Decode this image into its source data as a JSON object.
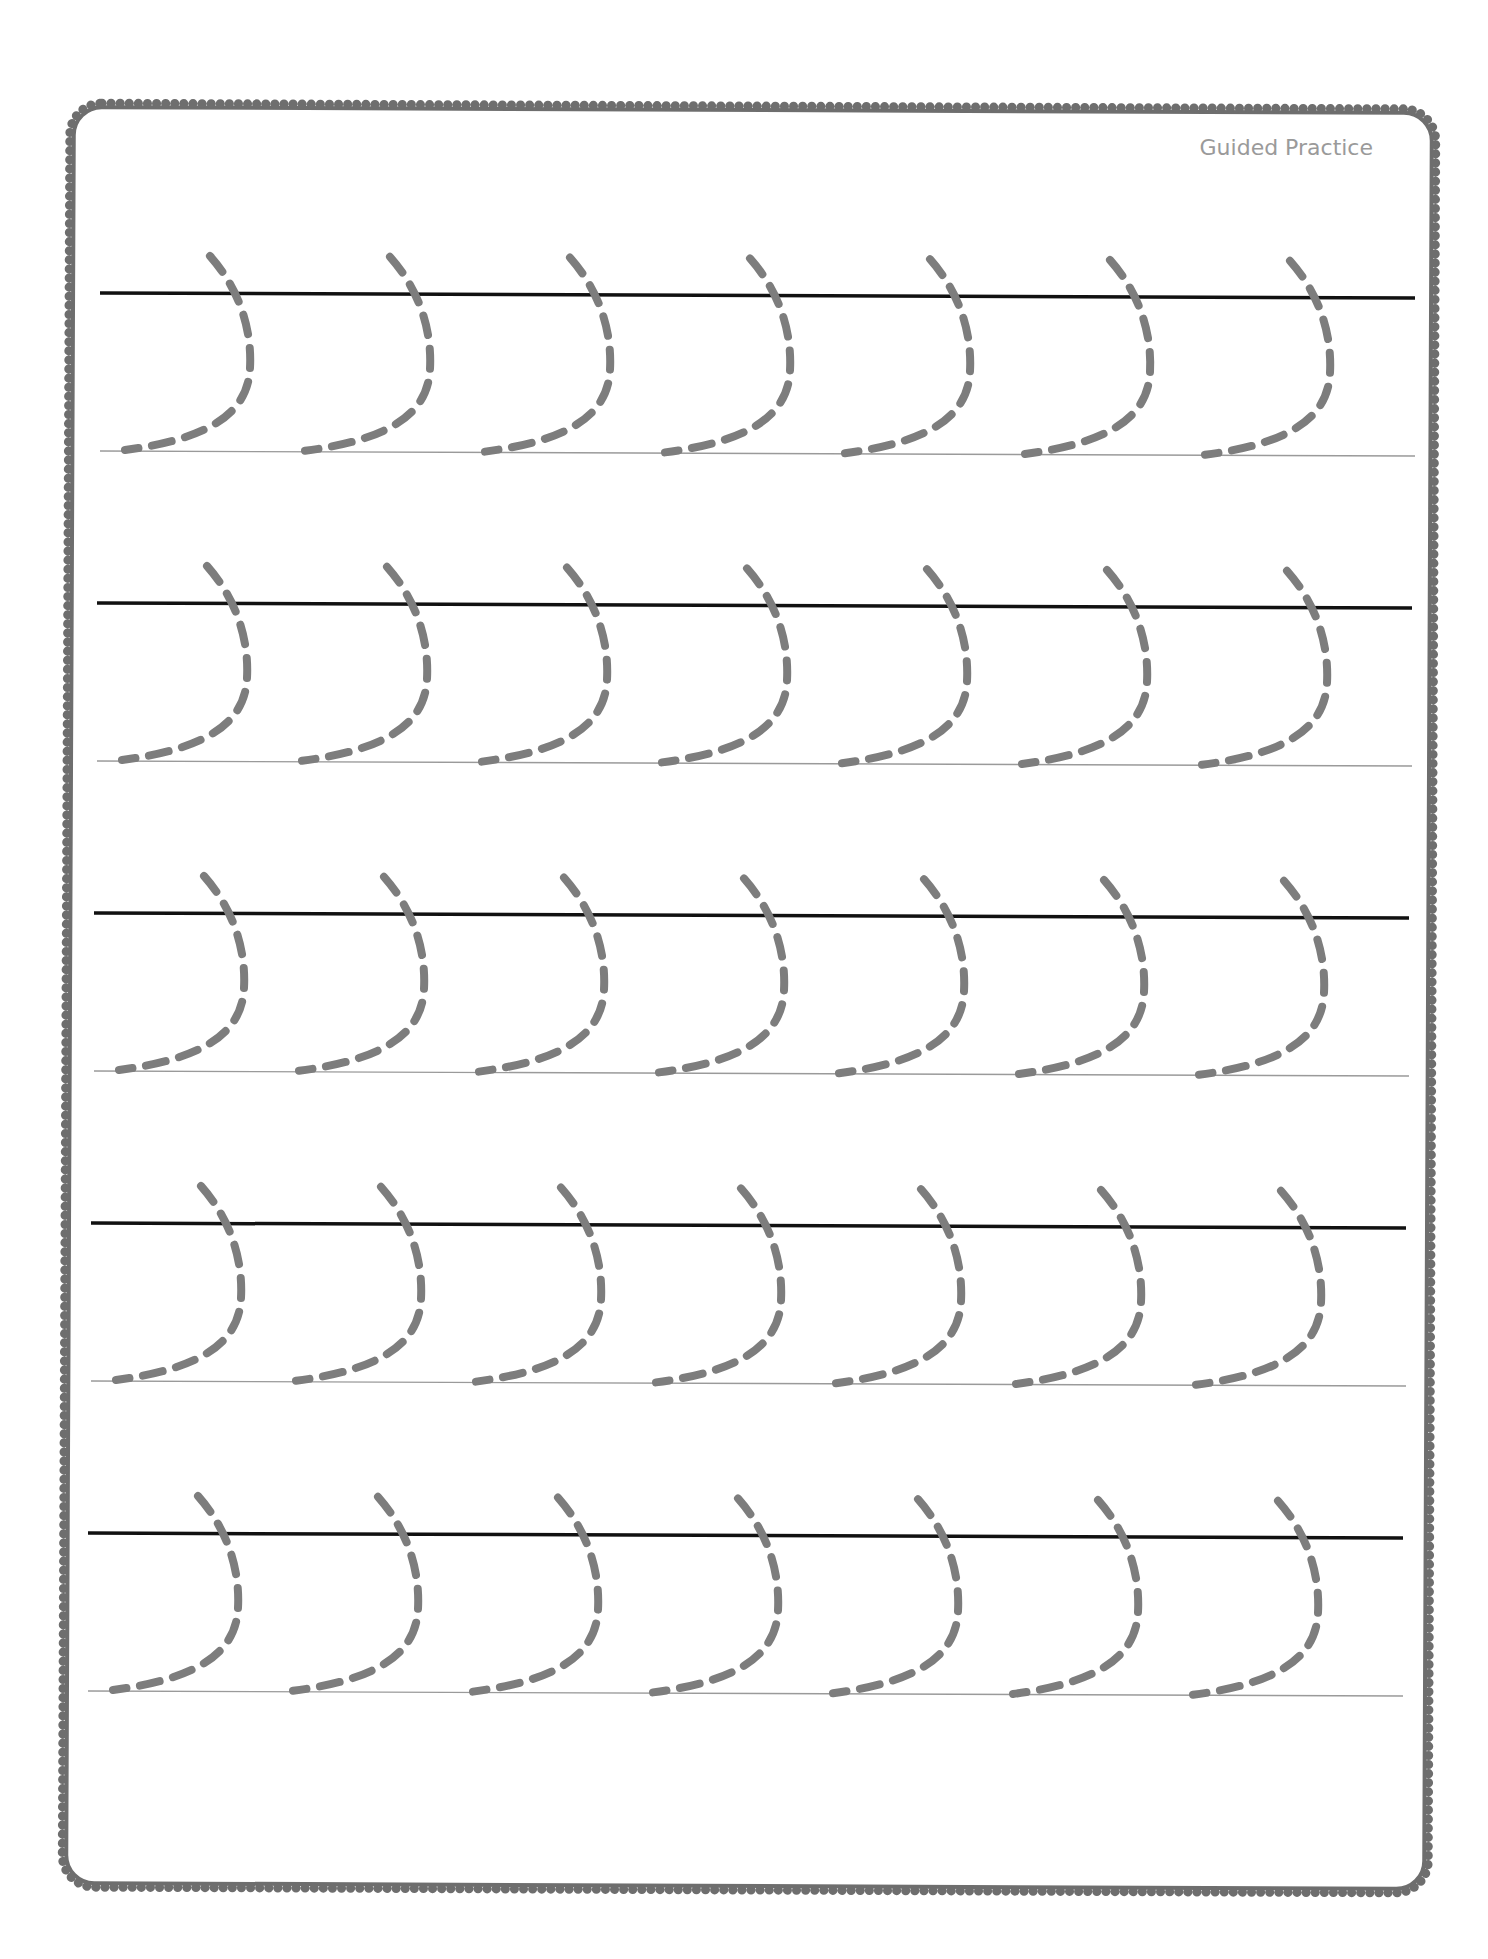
{
  "worksheet": {
    "label": "Guided Practice",
    "rows": 5,
    "glyphs_per_row": 7,
    "stroke_type": "dashed curved stroke (right-facing arc)",
    "colors": {
      "frame": "#6e6e6e",
      "headline": "#111111",
      "baseline": "#9a9a9a",
      "trace": "#7d7d7d",
      "label": "#9a9a9a"
    }
  }
}
